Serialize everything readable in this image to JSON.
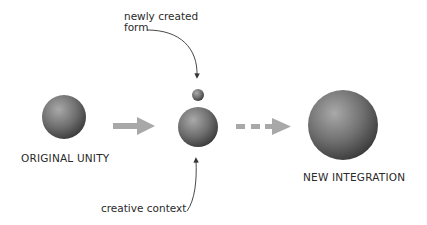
{
  "diagram": {
    "labels": {
      "original": "ORIGINAL UNITY",
      "new_integration": "NEW INTEGRATION",
      "newly_created_line1": "newly created",
      "newly_created_line2": "form",
      "creative_context": "creative context"
    },
    "nodes": [
      {
        "id": "original-unity",
        "cx": 64,
        "cy": 117,
        "r": 22
      },
      {
        "id": "newly-created-form",
        "cx": 198,
        "cy": 95,
        "r": 6
      },
      {
        "id": "middle-unity",
        "cx": 198,
        "cy": 127,
        "r": 20
      },
      {
        "id": "new-integration",
        "cx": 343,
        "cy": 125,
        "r": 35
      }
    ],
    "colors": {
      "sphere_light": "#a8a8a8",
      "sphere_dark": "#3a3a3a",
      "arrow": "#a8a8a8",
      "text": "#2a2a2a"
    }
  }
}
